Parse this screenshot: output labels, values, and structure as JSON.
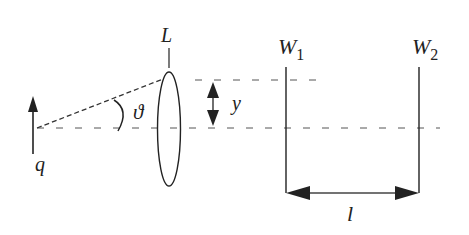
{
  "diagram": {
    "type": "optics-schematic",
    "colors": {
      "ink": "#222222",
      "dotted": "#555555",
      "background": "#ffffff"
    },
    "labels": {
      "lens": "L",
      "source": "q",
      "angle": "ϑ",
      "height": "y",
      "distance": "l",
      "wall1_base": "W",
      "wall1_sub": "1",
      "wall2_base": "W",
      "wall2_sub": "2"
    },
    "elements": [
      {
        "id": "source-arrow",
        "label": "q",
        "kind": "upward arrow (object)"
      },
      {
        "id": "ray",
        "kind": "dashed line from source to top of lens"
      },
      {
        "id": "angle-arc",
        "label": "ϑ",
        "kind": "angle between ray and optic axis"
      },
      {
        "id": "lens",
        "label": "L",
        "kind": "thin lens (ellipse)"
      },
      {
        "id": "height-arrow",
        "label": "y",
        "kind": "double-headed vertical arrow"
      },
      {
        "id": "optic-axis",
        "kind": "dotted horizontal line"
      },
      {
        "id": "wall-1",
        "label": "W1",
        "kind": "vertical screen"
      },
      {
        "id": "wall-2",
        "label": "W2",
        "kind": "vertical screen"
      },
      {
        "id": "separation-arrow",
        "label": "l",
        "kind": "double-headed horizontal arrow between W1 and W2"
      }
    ]
  }
}
